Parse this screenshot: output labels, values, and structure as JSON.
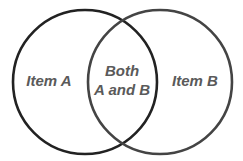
{
  "diagram": {
    "type": "venn",
    "sets": [
      {
        "id": "A",
        "label": "Item A",
        "circle": {
          "cx": 85,
          "cy": 82,
          "r": 72
        },
        "stroke_color": "#222222"
      },
      {
        "id": "B",
        "label": "Item B",
        "circle": {
          "cx": 160,
          "cy": 82,
          "r": 72
        },
        "stroke_color": "#444444"
      }
    ],
    "intersection": {
      "label_line1": "Both",
      "label_line2": "A and B"
    },
    "label_color": "#5a5a5a",
    "background": "#ffffff"
  }
}
